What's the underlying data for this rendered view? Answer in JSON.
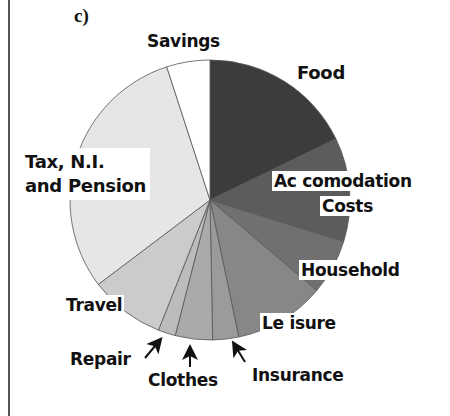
{
  "panel_label": "c)",
  "chart_data": {
    "type": "pie",
    "title": "",
    "panel": "c)",
    "start_angle_deg": 0,
    "direction": "clockwise",
    "slices": [
      {
        "label": "Food",
        "percent": 17.8,
        "color": "#3c3c3c"
      },
      {
        "label": "Accomodation Costs",
        "percent": 12.0,
        "color": "#5c5c5c"
      },
      {
        "label": "Household",
        "percent": 6.4,
        "color": "#707070"
      },
      {
        "label": "Leisure",
        "percent": 10.5,
        "color": "#878787"
      },
      {
        "label": "Insurance",
        "percent": 3.0,
        "color": "#9b9b9b"
      },
      {
        "label": "Clothes",
        "percent": 4.3,
        "color": "#aaaaaa"
      },
      {
        "label": "Repair",
        "percent": 2.0,
        "color": "#bcbcbc"
      },
      {
        "label": "Travel",
        "percent": 8.7,
        "color": "#cbcbcb"
      },
      {
        "label": "Tax, N.I. and Pension",
        "percent": 30.3,
        "color": "#e6e6e6"
      },
      {
        "label": "Savings",
        "percent": 5.0,
        "color": "#ffffff"
      }
    ],
    "legend": "none (direct labels)"
  },
  "labels": {
    "savings": "Savings",
    "food": "Food",
    "accom_line1": "Ac comodation",
    "accom_line2": "Costs",
    "household": "Household",
    "leisure": "Le isure",
    "insurance": "Insurance",
    "clothes": "Clothes",
    "repair": "Repair",
    "travel": "Travel",
    "tax_line1": "Tax, N.I.",
    "tax_line2": "and Pension"
  }
}
